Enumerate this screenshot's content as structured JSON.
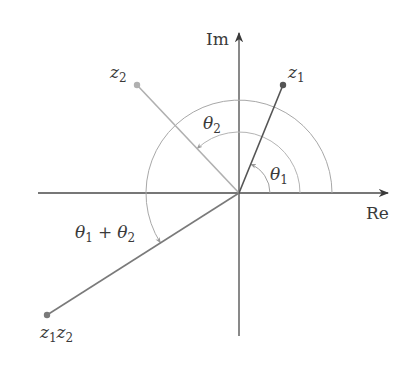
{
  "diagram": {
    "axes": {
      "real_label": "Re",
      "imag_label": "Im"
    },
    "points": [
      {
        "id": "z1",
        "label": "z",
        "sub": "1",
        "x": 283,
        "y": 85
      },
      {
        "id": "z2",
        "label": "z",
        "sub": "2",
        "x": 137,
        "y": 85
      },
      {
        "id": "z1z2",
        "label": "z",
        "sub": "1",
        "label2": "z",
        "sub2": "2",
        "x": 47,
        "y": 315
      }
    ],
    "angles": {
      "theta1": {
        "symbol": "θ",
        "sub": "1"
      },
      "theta2": {
        "symbol": "θ",
        "sub": "2"
      },
      "theta_sum": {
        "symbol": "θ",
        "sub": "1",
        "plus": "+",
        "symbol2": "θ",
        "sub2": "2"
      }
    },
    "colors": {
      "axis": "#4a4a4a",
      "z1_line": "#555555",
      "z2_line": "#b0b0b0",
      "z1z2_line": "#7a7a7a",
      "arc": "#a8a8a8",
      "text": "#3a3a3a"
    }
  }
}
